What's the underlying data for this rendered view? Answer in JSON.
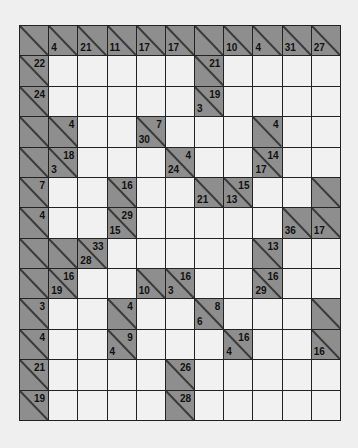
{
  "puzzle": {
    "type": "kakuro",
    "columns": 11,
    "rows": 13,
    "colors": {
      "clue_cell": "#8e8e8e",
      "white_cell": "#f1f1f1",
      "grid_line": "#222222",
      "background": "#efefef"
    },
    "grid": [
      [
        {
          "c": 1
        },
        {
          "c": 1,
          "d": "4"
        },
        {
          "c": 1,
          "d": "21"
        },
        {
          "c": 1,
          "d": "11"
        },
        {
          "c": 1,
          "d": "17"
        },
        {
          "c": 1,
          "d": "17"
        },
        {
          "c": 1
        },
        {
          "c": 1,
          "d": "10"
        },
        {
          "c": 1,
          "d": "4"
        },
        {
          "c": 1,
          "d": "31"
        },
        {
          "c": 1,
          "d": "27"
        }
      ],
      [
        {
          "c": 1,
          "a": "22"
        },
        {},
        {},
        {},
        {},
        {},
        {
          "c": 1,
          "a": "21"
        },
        {},
        {},
        {},
        {}
      ],
      [
        {
          "c": 1,
          "a": "24"
        },
        {},
        {},
        {},
        {},
        {},
        {
          "c": 1,
          "a": "19",
          "d": "3"
        },
        {},
        {},
        {},
        {}
      ],
      [
        {
          "c": 1
        },
        {
          "c": 1,
          "a": "4"
        },
        {},
        {},
        {
          "c": 1,
          "a": "7",
          "d": "30"
        },
        {},
        {},
        {},
        {
          "c": 1,
          "a": "4"
        },
        {},
        {}
      ],
      [
        {
          "c": 1
        },
        {
          "c": 1,
          "a": "18",
          "d": "3"
        },
        {},
        {},
        {},
        {
          "c": 1,
          "a": "4",
          "d": "24"
        },
        {},
        {},
        {
          "c": 1,
          "a": "14",
          "d": "17"
        },
        {},
        {}
      ],
      [
        {
          "c": 1,
          "a": "7"
        },
        {},
        {},
        {
          "c": 1,
          "a": "16"
        },
        {},
        {},
        {
          "c": 1,
          "d": "21"
        },
        {
          "c": 1,
          "a": "15",
          "d": "13"
        },
        {},
        {},
        {
          "c": 1
        }
      ],
      [
        {
          "c": 1,
          "a": "4"
        },
        {},
        {},
        {
          "c": 1,
          "a": "29",
          "d": "15"
        },
        {},
        {},
        {},
        {},
        {},
        {
          "c": 1,
          "d": "36"
        },
        {
          "c": 1,
          "d": "17"
        }
      ],
      [
        {
          "c": 1
        },
        {
          "c": 1
        },
        {
          "c": 1,
          "a": "33",
          "d": "28"
        },
        {},
        {},
        {},
        {},
        {},
        {
          "c": 1,
          "a": "13"
        },
        {},
        {}
      ],
      [
        {
          "c": 1
        },
        {
          "c": 1,
          "a": "16",
          "d": "19"
        },
        {},
        {},
        {
          "c": 1,
          "d": "10"
        },
        {
          "c": 1,
          "a": "16",
          "d": "3"
        },
        {},
        {},
        {
          "c": 1,
          "a": "16",
          "d": "29"
        },
        {},
        {}
      ],
      [
        {
          "c": 1,
          "a": "3"
        },
        {},
        {},
        {
          "c": 1,
          "a": "4"
        },
        {},
        {},
        {
          "c": 1,
          "a": "8",
          "d": "6"
        },
        {},
        {},
        {},
        {
          "c": 1
        }
      ],
      [
        {
          "c": 1,
          "a": "4"
        },
        {},
        {},
        {
          "c": 1,
          "a": "9",
          "d": "4"
        },
        {},
        {},
        {},
        {
          "c": 1,
          "a": "16",
          "d": "4"
        },
        {},
        {},
        {
          "c": 1,
          "d": "16"
        }
      ],
      [
        {
          "c": 1,
          "a": "21"
        },
        {},
        {},
        {},
        {},
        {
          "c": 1,
          "a": "26"
        },
        {},
        {},
        {},
        {},
        {}
      ],
      [
        {
          "c": 1,
          "a": "19"
        },
        {},
        {},
        {},
        {},
        {
          "c": 1,
          "a": "28"
        },
        {},
        {},
        {},
        {},
        {}
      ]
    ]
  }
}
